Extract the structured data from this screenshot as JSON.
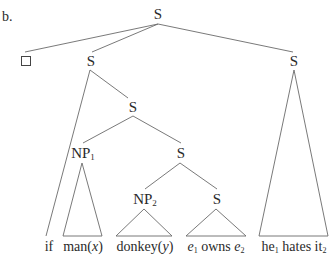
{
  "example_label": "b.",
  "nodes": {
    "root": "S",
    "left_s": "S",
    "right_s": "S",
    "mid_s": "S",
    "np1": {
      "base": "NP",
      "sub": "1"
    },
    "inner_s": "S",
    "np2": {
      "base": "NP",
      "sub": "2"
    },
    "low_s": "S",
    "empty_box": "□"
  },
  "leaves": {
    "if": "if",
    "man": {
      "word": "man(",
      "var": "x",
      "close": ")"
    },
    "donkey": {
      "word": "donkey(",
      "var": "y",
      "close": ")"
    },
    "owns": {
      "e1": "e",
      "e1_sub": "1",
      "verb": " owns ",
      "e2": "e",
      "e2_sub": "2"
    },
    "hates": {
      "he": "he",
      "he_sub": "1",
      "verb": " hates ",
      "it": "it",
      "it_sub": "2"
    }
  },
  "line_color": "#6a6a6a"
}
